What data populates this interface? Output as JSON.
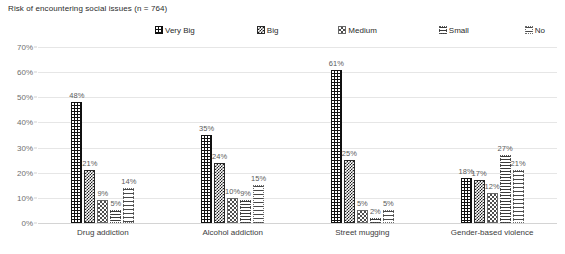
{
  "chart_data": {
    "type": "bar",
    "title": "Risk of encountering social issues (n = 764)",
    "xlabel": "",
    "ylabel": "",
    "ylim": [
      0,
      70
    ],
    "ytick_labels": [
      "0%",
      "10%",
      "20%",
      "30%",
      "40%",
      "50%",
      "60%",
      "70%"
    ],
    "ytick_values": [
      0,
      10,
      20,
      30,
      40,
      50,
      60,
      70
    ],
    "grid": true,
    "legend_position": "top-center",
    "categories": [
      "Drug addiction",
      "Alcohol addiction",
      "Street mugging",
      "Gender-based violence"
    ],
    "series": [
      {
        "name": "Very Big",
        "pattern": "black-with-white-dots",
        "values": [
          48,
          35,
          61,
          18
        ],
        "labels": [
          "48%",
          "35%",
          "61%",
          "18%"
        ]
      },
      {
        "name": "Big",
        "pattern": "dense-checker",
        "values": [
          21,
          24,
          25,
          17
        ],
        "labels": [
          "21%",
          "24%",
          "25%",
          "17%"
        ]
      },
      {
        "name": "Medium",
        "pattern": "grey-grid",
        "values": [
          9,
          10,
          5,
          12
        ],
        "labels": [
          "9%",
          "10%",
          "5%",
          "12%"
        ]
      },
      {
        "name": "Small",
        "pattern": "dense-vertical-dots",
        "values": [
          5,
          9,
          2,
          27
        ],
        "labels": [
          "5%",
          "9%",
          "2%",
          "27%"
        ]
      },
      {
        "name": "No",
        "pattern": "sparse-vertical-dots",
        "values": [
          14,
          15,
          5,
          21
        ],
        "labels": [
          "14%",
          "15%",
          "5%",
          "21%"
        ]
      }
    ]
  },
  "colors": {
    "background": "#ffffff",
    "gridline": "#e6e6e6",
    "axis_text": "#6f6f6f",
    "label_text": "#5b5b5b",
    "title_text": "#2b2b2b",
    "series_dark": "#111111"
  }
}
